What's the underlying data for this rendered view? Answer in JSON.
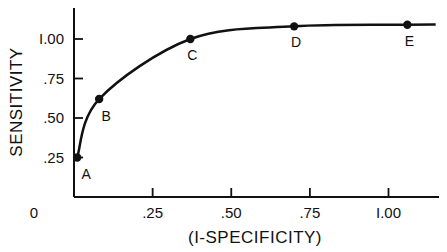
{
  "chart_data": {
    "type": "line",
    "title": "",
    "xlabel": "(I-SPECIFICITY)",
    "ylabel": "SENSITIVITY",
    "xlim": [
      0,
      1.15
    ],
    "ylim": [
      0,
      1.2
    ],
    "grid": false,
    "legend": null,
    "x_ticks": [
      {
        "value": 0,
        "label": "0"
      },
      {
        "value": 0.25,
        "label": ".25"
      },
      {
        "value": 0.5,
        "label": ".50"
      },
      {
        "value": 0.75,
        "label": ".75"
      },
      {
        "value": 1.0,
        "label": "I.00"
      }
    ],
    "y_ticks": [
      {
        "value": 0.25,
        "label": ".25"
      },
      {
        "value": 0.5,
        "label": ".50"
      },
      {
        "value": 0.75,
        "label": ".75"
      },
      {
        "value": 1.0,
        "label": "I.00"
      }
    ],
    "series": [
      {
        "name": "curve",
        "points": [
          {
            "label": "A",
            "x": 0.01,
            "y": 0.25
          },
          {
            "label": "B",
            "x": 0.08,
            "y": 0.62
          },
          {
            "label": "C",
            "x": 0.37,
            "y": 1.0
          },
          {
            "label": "D",
            "x": 0.7,
            "y": 1.08
          },
          {
            "label": "E",
            "x": 1.06,
            "y": 1.09
          }
        ],
        "curve_extends_to_x": 1.15
      }
    ]
  },
  "colors": {
    "ink": "#111111",
    "background": "#ffffff"
  }
}
